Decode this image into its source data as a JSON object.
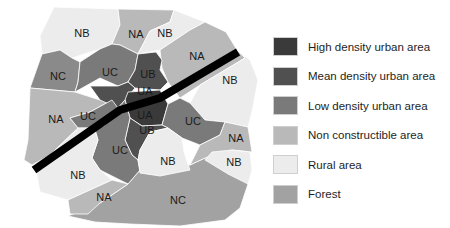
{
  "colors": {
    "UA": "#3a3a3a",
    "UB": "#505050",
    "UC": "#7a7a7a",
    "NA": "#b9b9b9",
    "NB": "#ececec",
    "NC": "#a2a2a2",
    "road": "#000000",
    "border": "#ffffff"
  },
  "legend": [
    {
      "code": "UA",
      "label": "High density urban area",
      "color": "#3a3a3a"
    },
    {
      "code": "UB",
      "label": "Mean density urban area",
      "color": "#505050"
    },
    {
      "code": "UC",
      "label": "Low density urban area",
      "color": "#7a7a7a"
    },
    {
      "code": "NA",
      "label": "Non constructible area",
      "color": "#b9b9b9"
    },
    {
      "code": "NB",
      "label": "Rural area",
      "color": "#ececec"
    },
    {
      "code": "NC",
      "label": "Forest",
      "color": "#a2a2a2"
    }
  ],
  "regions": [
    {
      "code": "NB",
      "label": "NB",
      "x": 82,
      "y": 34
    },
    {
      "code": "NA",
      "label": "NA",
      "x": 136,
      "y": 35
    },
    {
      "code": "NB",
      "label": "NB",
      "x": 165,
      "y": 34
    },
    {
      "code": "NA",
      "label": "NA",
      "x": 197,
      "y": 57
    },
    {
      "code": "NB",
      "label": "NB",
      "x": 230,
      "y": 81
    },
    {
      "code": "NC",
      "label": "NC",
      "x": 58,
      "y": 77
    },
    {
      "code": "UC",
      "label": "UC",
      "x": 110,
      "y": 73
    },
    {
      "code": "UB",
      "label": "UB",
      "x": 148,
      "y": 75
    },
    {
      "code": "UA",
      "label": "UA",
      "x": 145,
      "y": 92
    },
    {
      "code": "UA",
      "label": "UA",
      "x": 145,
      "y": 116
    },
    {
      "code": "UB",
      "label": "UB",
      "x": 147,
      "y": 131
    },
    {
      "code": "NA",
      "label": "NA",
      "x": 56,
      "y": 120
    },
    {
      "code": "UC",
      "label": "UC",
      "x": 88,
      "y": 117
    },
    {
      "code": "UC",
      "label": "UC",
      "x": 193,
      "y": 122
    },
    {
      "code": "UC",
      "label": "UC",
      "x": 120,
      "y": 151
    },
    {
      "code": "NA",
      "label": "NA",
      "x": 236,
      "y": 139
    },
    {
      "code": "NB",
      "label": "NB",
      "x": 168,
      "y": 162
    },
    {
      "code": "NB",
      "label": "NB",
      "x": 234,
      "y": 163
    },
    {
      "code": "NB",
      "label": "NB",
      "x": 78,
      "y": 176
    },
    {
      "code": "NA",
      "label": "NA",
      "x": 104,
      "y": 198
    },
    {
      "code": "NC",
      "label": "NC",
      "x": 178,
      "y": 201
    }
  ]
}
